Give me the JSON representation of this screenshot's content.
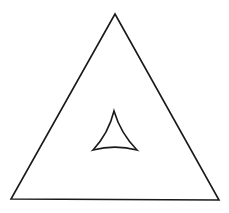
{
  "diagram": {
    "colors": {
      "background": "#ffffff",
      "stroke": "#1a1a1a"
    },
    "outer_triangle": {
      "vertices": [
        [
          115,
          14
        ],
        [
          11,
          199
        ],
        [
          219,
          200
        ]
      ],
      "stroke_width": 1.6
    },
    "inner_deltoid": {
      "cusps": [
        [
          114,
          111
        ],
        [
          93,
          150
        ],
        [
          137,
          150
        ]
      ],
      "stroke_width": 1.6
    }
  }
}
